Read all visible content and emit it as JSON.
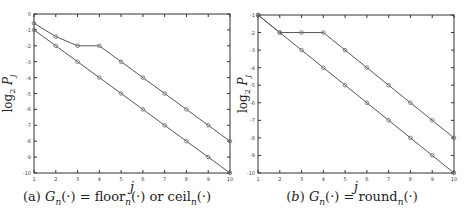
{
  "chart_data": [
    {
      "type": "line",
      "caption": "(a) G_n(·) = floor_n(·) or ceil_n(·)",
      "caption_parts": {
        "label": "(a)",
        "lhs": "G",
        "sub": "n",
        "rest": "(·) = floor",
        "sub2": "n",
        "rest2": "(·) or ceil",
        "sub3": "n",
        "rest3": "(·)"
      },
      "xlabel": "j",
      "ylabel": "log2 P_j",
      "x": [
        1,
        2,
        3,
        4,
        5,
        6,
        7,
        8,
        9,
        10
      ],
      "xticks": [
        "1",
        "2",
        "3",
        "4",
        "5",
        "6",
        "7",
        "8",
        "9",
        "10"
      ],
      "yticks": [
        "0",
        "-1",
        "-2",
        "-3",
        "-4",
        "-5",
        "-6",
        "-7",
        "-8",
        "-9",
        "-10"
      ],
      "ylim": [
        -10,
        0
      ],
      "xlim": [
        1,
        10
      ],
      "grid": false,
      "series": [
        {
          "name": "upper",
          "values": [
            -0.58,
            -1.42,
            -2,
            -2,
            -3,
            -4,
            -5,
            -6,
            -7,
            -8
          ]
        },
        {
          "name": "lower",
          "values": [
            -1,
            -2,
            -3,
            -4,
            -5,
            -6,
            -7,
            -8,
            -9,
            -10
          ]
        }
      ]
    },
    {
      "type": "line",
      "caption": "(b) G_n(·) = round_n(·)",
      "xlabel": "j",
      "ylabel": "log2 P_j",
      "x": [
        1,
        2,
        3,
        4,
        5,
        6,
        7,
        8,
        9,
        10
      ],
      "xticks": [
        "1",
        "2",
        "3",
        "4",
        "5",
        "6",
        "7",
        "8",
        "9",
        "10"
      ],
      "yticks": [
        "-1",
        "-2",
        "-3",
        "-4",
        "-5",
        "-6",
        "-7",
        "-8",
        "-9",
        "-10"
      ],
      "ylim": [
        -10,
        -1
      ],
      "xlim": [
        1,
        10
      ],
      "grid": false,
      "series": [
        {
          "name": "upper",
          "values": [
            -1,
            -2,
            -2,
            -2,
            -3,
            -4,
            -5,
            -6,
            -7,
            -8
          ]
        },
        {
          "name": "lower",
          "values": [
            -1,
            -2,
            -3,
            -4,
            -5,
            -6,
            -7,
            -8,
            -9,
            -10
          ]
        }
      ]
    }
  ],
  "colors": {
    "line": "#555555",
    "axis": "#333333",
    "marker": "#666666"
  }
}
